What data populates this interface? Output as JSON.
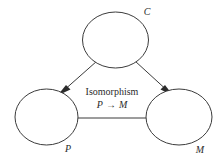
{
  "diagram": {
    "type": "node-link-diagram",
    "background_color": "#ffffff",
    "stroke_color": "#3b3b3b",
    "text_color": "#2b2b2b",
    "nodes": [
      {
        "id": "C",
        "label": "C",
        "label_style": "italic",
        "role": "top-node",
        "cx": 115.5,
        "cy": 40,
        "rx": 33,
        "ry": 28,
        "label_x": 148,
        "label_y": 14
      },
      {
        "id": "P",
        "label": "P",
        "label_style": "italic",
        "role": "bottom-left-node",
        "cx": 46.5,
        "cy": 117,
        "rx": 31.5,
        "ry": 28,
        "label_x": 68,
        "label_y": 150
      },
      {
        "id": "M",
        "label": "M",
        "label_style": "italic",
        "role": "bottom-right-node",
        "cx": 179,
        "cy": 117,
        "rx": 33,
        "ry": 28,
        "label_x": 199,
        "label_y": 152
      }
    ],
    "edges": [
      {
        "id": "C-to-P",
        "from": "C",
        "to": "P",
        "directed": true,
        "arrowhead": "filled-triangle",
        "x1": 96,
        "y1": 62,
        "x2": 64,
        "y2": 90
      },
      {
        "id": "C-to-M",
        "from": "C",
        "to": "M",
        "directed": true,
        "arrowhead": "filled-triangle",
        "x1": 136,
        "y1": 62,
        "x2": 167,
        "y2": 90
      },
      {
        "id": "P-to-M",
        "from": "P",
        "to": "M",
        "directed": false,
        "arrowhead": "none",
        "x1": 78,
        "y1": 118,
        "x2": 146,
        "y2": 118,
        "caption_line1": "Isomorphism",
        "caption_line2_left": "P",
        "caption_line2_arrow": "→",
        "caption_line2_right": "M",
        "caption_x": 112,
        "caption_y1": 95,
        "caption_y2": 108
      }
    ]
  }
}
